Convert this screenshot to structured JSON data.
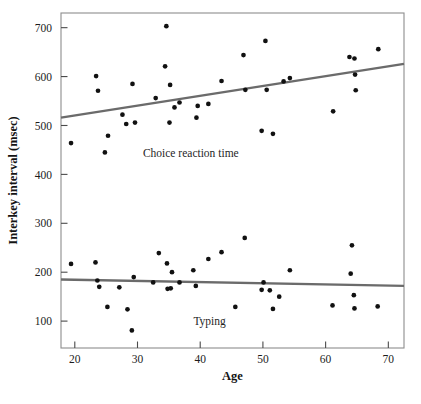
{
  "chart_data": {
    "type": "scatter",
    "title": "",
    "xlabel": "Age",
    "ylabel": "Interkey interval (msec)",
    "xlim": [
      17.8,
      72.5
    ],
    "ylim": [
      45,
      730
    ],
    "xticks": [
      20,
      30,
      40,
      50,
      60,
      70
    ],
    "yticks": [
      100,
      200,
      300,
      400,
      500,
      600,
      700
    ],
    "grid": false,
    "legend_position": "inline-annotations",
    "frame": "box",
    "annotations": [
      {
        "text": "Choice reaction time",
        "x": 38.5,
        "y": 435
      },
      {
        "text": "Typing",
        "x": 41.5,
        "y": 92
      }
    ],
    "series": [
      {
        "name": "Choice reaction time",
        "marker": "filled-circle",
        "color": "#111111",
        "points": [
          [
            19.4,
            464
          ],
          [
            23.4,
            601
          ],
          [
            23.7,
            571
          ],
          [
            24.8,
            445
          ],
          [
            25.3,
            479
          ],
          [
            27.6,
            522
          ],
          [
            28.2,
            503
          ],
          [
            29.6,
            506
          ],
          [
            29.2,
            585
          ],
          [
            32.9,
            556
          ],
          [
            34.4,
            621
          ],
          [
            34.6,
            703
          ],
          [
            35.2,
            583
          ],
          [
            35.1,
            506
          ],
          [
            35.9,
            537
          ],
          [
            36.7,
            547
          ],
          [
            39.4,
            516
          ],
          [
            39.6,
            540
          ],
          [
            41.3,
            544
          ],
          [
            43.4,
            591
          ],
          [
            46.9,
            644
          ],
          [
            47.2,
            573
          ],
          [
            49.8,
            489
          ],
          [
            50.4,
            673
          ],
          [
            50.6,
            573
          ],
          [
            51.6,
            483
          ],
          [
            53.3,
            590
          ],
          [
            54.3,
            597
          ],
          [
            61.2,
            529
          ],
          [
            63.8,
            640
          ],
          [
            64.6,
            637
          ],
          [
            64.7,
            604
          ],
          [
            64.8,
            572
          ],
          [
            68.4,
            656
          ]
        ]
      },
      {
        "name": "Typing",
        "marker": "filled-circle",
        "color": "#111111",
        "points": [
          [
            19.4,
            217
          ],
          [
            23.3,
            220
          ],
          [
            23.6,
            183
          ],
          [
            23.9,
            170
          ],
          [
            25.2,
            129
          ],
          [
            27.1,
            169
          ],
          [
            28.4,
            124
          ],
          [
            29.1,
            81
          ],
          [
            29.4,
            190
          ],
          [
            32.5,
            179
          ],
          [
            33.4,
            239
          ],
          [
            34.7,
            218
          ],
          [
            34.8,
            166
          ],
          [
            35.3,
            167
          ],
          [
            35.5,
            200
          ],
          [
            36.7,
            179
          ],
          [
            38.9,
            204
          ],
          [
            39.3,
            172
          ],
          [
            41.3,
            227
          ],
          [
            43.4,
            241
          ],
          [
            45.6,
            129
          ],
          [
            47.1,
            270
          ],
          [
            49.8,
            164
          ],
          [
            50.1,
            179
          ],
          [
            51.1,
            163
          ],
          [
            51.6,
            125
          ],
          [
            52.6,
            150
          ],
          [
            54.3,
            204
          ],
          [
            61.1,
            132
          ],
          [
            64.0,
            197
          ],
          [
            64.2,
            255
          ],
          [
            64.5,
            153
          ],
          [
            64.6,
            126
          ],
          [
            68.3,
            130
          ]
        ]
      }
    ],
    "trendlines": [
      {
        "name": "Choice reaction time trend",
        "color": "#6b6b6b",
        "x_start": 17.8,
        "y_start": 516,
        "x_end": 72.5,
        "y_end": 626
      },
      {
        "name": "Typing trend",
        "color": "#6b6b6b",
        "x_start": 17.8,
        "y_start": 185,
        "x_end": 72.5,
        "y_end": 172
      }
    ]
  },
  "caption": {
    "text": ""
  }
}
